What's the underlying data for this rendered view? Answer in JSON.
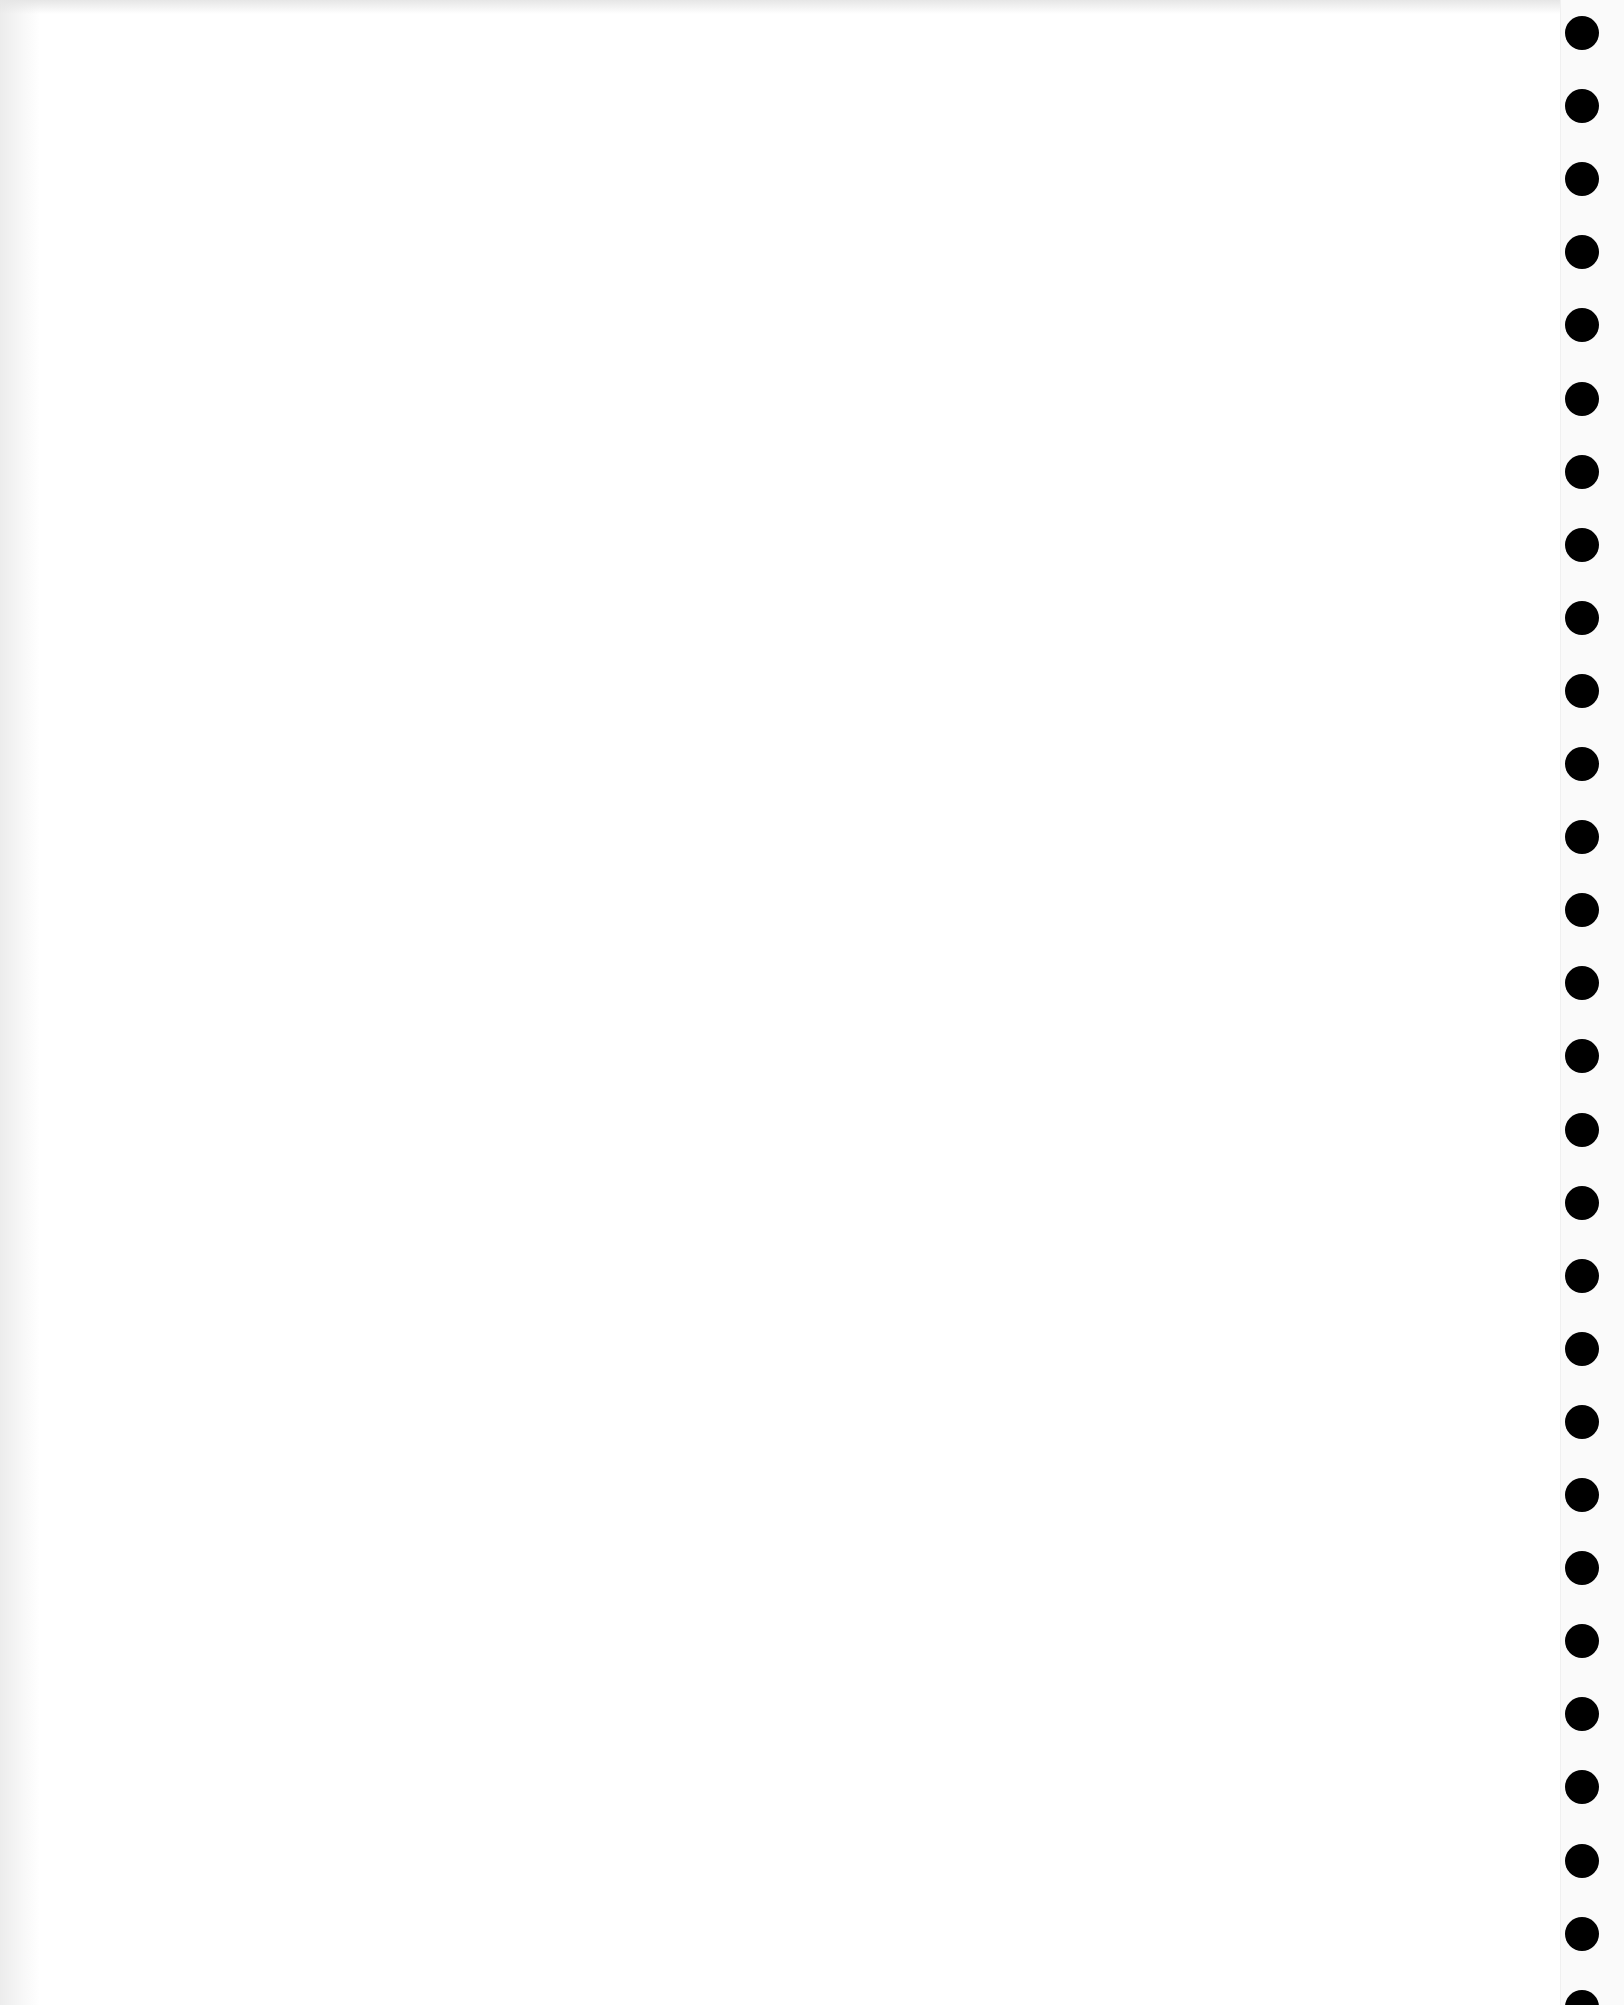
{
  "document": {
    "type": "blank scanned page",
    "text": "",
    "punch_holes": {
      "count": 28,
      "side": "right",
      "color": "#000000",
      "first_center_y": 33,
      "spacing_px": 73.1,
      "diameter_px": 34
    }
  }
}
